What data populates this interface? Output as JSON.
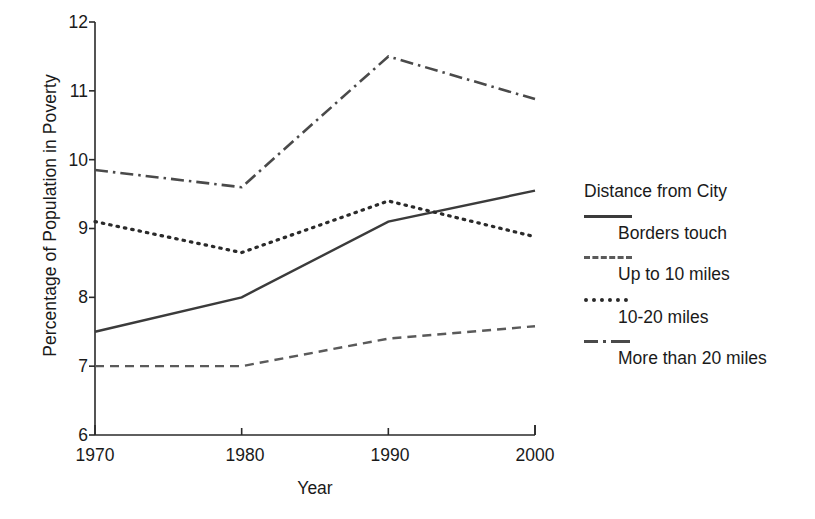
{
  "chart_data": {
    "type": "line",
    "title": "",
    "xlabel": "Year",
    "ylabel": "Percentage of Population in Poverty",
    "x": [
      1970,
      1980,
      1990,
      2000
    ],
    "xtick_labels": [
      "1970",
      "1980",
      "1990",
      "2000"
    ],
    "ytick_labels": [
      "6",
      "7",
      "8",
      "9",
      "10",
      "11",
      "12"
    ],
    "xlim": [
      1970,
      2000
    ],
    "ylim": [
      6,
      12
    ],
    "grid": false,
    "legend_position": "right",
    "legend_title": "Distance from City",
    "series": [
      {
        "name": "Borders touch",
        "style": "solid",
        "color": "#3b3b3b",
        "values": [
          7.5,
          8.0,
          9.1,
          9.55
        ]
      },
      {
        "name": "Up to 10 miles",
        "style": "dashed",
        "color": "#5a5a5a",
        "values": [
          7.0,
          7.0,
          7.4,
          7.58
        ]
      },
      {
        "name": "10-20 miles",
        "style": "dotted",
        "color": "#2a2a2a",
        "values": [
          9.1,
          8.65,
          9.4,
          8.88
        ]
      },
      {
        "name": "More than 20 miles",
        "style": "dashdot",
        "color": "#4a4a4a",
        "values": [
          9.85,
          9.6,
          11.5,
          10.88
        ]
      }
    ]
  },
  "axes": {
    "y_title": "Percentage of Population in Poverty",
    "x_title": "Year",
    "y_ticks": [
      "12",
      "11",
      "10",
      "9",
      "8",
      "7",
      "6"
    ],
    "x_ticks": [
      "1970",
      "1980",
      "1990",
      "2000"
    ]
  },
  "legend": {
    "title": "Distance from City",
    "entries": [
      {
        "label": "Borders touch",
        "swatch": "solid-line-swatch"
      },
      {
        "label": "Up to 10 miles",
        "swatch": "dashed-line-swatch"
      },
      {
        "label": "10-20 miles",
        "swatch": "dotted-line-swatch"
      },
      {
        "label": "More than 20 miles",
        "swatch": "dash-dot-line-swatch"
      }
    ]
  },
  "colors": {
    "axis": "#2a2a2a",
    "text": "#1a1a1a",
    "background": "#ffffff"
  }
}
